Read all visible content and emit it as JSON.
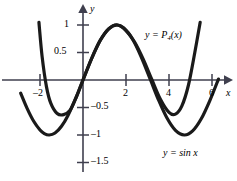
{
  "figure": {
    "background": "#ffffff",
    "curve_color": "#1a1a1a",
    "axis_color": "#3a3a4a"
  },
  "axes": {
    "y_axis_label": "y",
    "x_axis_label": "x",
    "x_ticks": [
      {
        "value": -2,
        "label": "–2"
      },
      {
        "value": 2,
        "label": "2"
      },
      {
        "value": 4,
        "label": "4"
      },
      {
        "value": 6,
        "label": "6"
      }
    ],
    "y_ticks": [
      {
        "value": 1,
        "label": "1"
      },
      {
        "value": 0.5,
        "label": "0.5"
      },
      {
        "value": -0.5,
        "label": "–0.5"
      },
      {
        "value": -1,
        "label": "–1"
      },
      {
        "value": -1.5,
        "label": "–1.5"
      }
    ]
  },
  "annotations": {
    "taylor_label_prefix": "y = P",
    "taylor_label_sub": "4",
    "taylor_label_suffix": "(x)",
    "sine_label": "y = sin x"
  },
  "chart_data": {
    "type": "line",
    "title": "",
    "xlabel": "x",
    "ylabel": "y",
    "xlim": [
      -2.9,
      6.6
    ],
    "ylim": [
      -1.9,
      1.25
    ],
    "grid": false,
    "legend": "inline-annotations",
    "xticks": [
      -2,
      2,
      4,
      6
    ],
    "yticks": [
      1,
      0.5,
      -0.5,
      -1,
      -1.5
    ],
    "series": [
      {
        "name": "y = sin x",
        "annotation": "y = sin x",
        "x": [
          -2.9,
          -2.6,
          -2.3,
          -2.0,
          -1.8,
          -1.5708,
          -1.3,
          -1.0,
          -0.7,
          -0.3,
          0,
          0.4,
          0.8,
          1.2,
          1.5708,
          1.9,
          2.3,
          2.7,
          3.1416,
          3.5,
          3.9,
          4.3,
          4.7124,
          5.1,
          5.5,
          5.9,
          6.3
        ],
        "y": [
          -0.239,
          -0.516,
          -0.746,
          -0.909,
          -0.974,
          -1.0,
          -0.964,
          -0.841,
          -0.644,
          -0.296,
          0,
          0.389,
          0.717,
          0.932,
          1.0,
          0.946,
          0.746,
          0.427,
          0,
          -0.351,
          -0.688,
          -0.916,
          -1.0,
          -0.926,
          -0.706,
          -0.374,
          0.017
        ]
      },
      {
        "name": "y = P4(x)",
        "annotation": "y = P₄(x)",
        "note": "Taylor-type polynomial approximation of sin x; agrees near x=0 to x=3 and diverges upward outside",
        "x": [
          -2.05,
          -1.9,
          -1.7,
          -1.5,
          -1.2,
          -0.9,
          -0.6,
          -0.3,
          0,
          0.4,
          0.8,
          1.2,
          1.6,
          2.0,
          2.4,
          2.8,
          3.2,
          3.6,
          4.0,
          4.3,
          4.6,
          4.9,
          5.2,
          5.45
        ],
        "y": [
          1.05,
          0.42,
          -0.12,
          -0.42,
          -0.61,
          -0.63,
          -0.55,
          -0.3,
          0.0,
          0.39,
          0.72,
          0.93,
          1.0,
          0.9,
          0.69,
          0.38,
          0.01,
          -0.35,
          -0.59,
          -0.62,
          -0.47,
          -0.1,
          0.5,
          1.05
        ]
      }
    ]
  }
}
